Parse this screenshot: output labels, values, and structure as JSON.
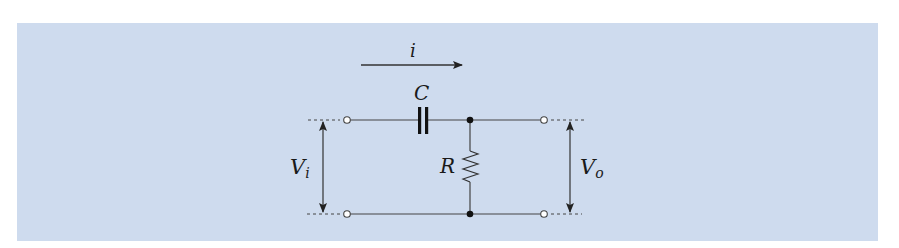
{
  "diagram": {
    "background_color": "#cedbee",
    "line_color": "#333333",
    "labels": {
      "current": "i",
      "capacitor": "C",
      "resistor": "R",
      "input_voltage_main": "V",
      "input_voltage_sub": "i",
      "output_voltage_main": "V",
      "output_voltage_sub": "o"
    },
    "components": [
      {
        "type": "capacitor",
        "label": "C",
        "position": "series, top wire"
      },
      {
        "type": "resistor",
        "label": "R",
        "position": "shunt, between top and bottom wire"
      }
    ],
    "terminals": [
      "input-top",
      "input-bottom",
      "output-top",
      "output-bottom"
    ],
    "nodes": [
      "junction-top",
      "junction-bottom"
    ]
  }
}
